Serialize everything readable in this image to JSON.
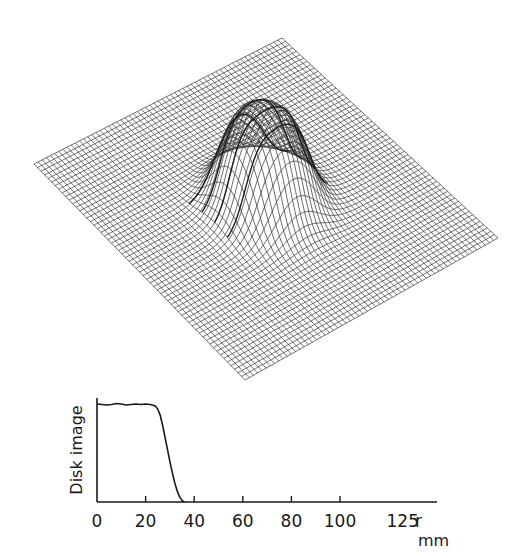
{
  "chart_data": [
    {
      "type": "surface",
      "name": "3D wire-mesh surface of disk image",
      "description": "Oblique wire-frame surface on a flat square grid, with a raised flat-topped cylindrical bump (disk) near the center",
      "plane_corners_px": {
        "top": [
          282,
          38
        ],
        "right": [
          498,
          238
        ],
        "bottom": [
          245,
          380
        ],
        "left": [
          34,
          164
        ]
      },
      "grid_lines_per_side": 60,
      "bump": {
        "center_uv": [
          0.5,
          0.5
        ],
        "radius_uv": 0.14,
        "height_px": 95,
        "edge_sharpness": 0.06
      },
      "line_color": "#3a3a3a"
    },
    {
      "type": "line",
      "title": "",
      "xlabel": "r",
      "xlabel_unit": "mm",
      "ylabel": "Disk image",
      "xlim": [
        0,
        140
      ],
      "ylim": [
        0,
        1.05
      ],
      "x_ticks": [
        0,
        20,
        40,
        60,
        80,
        100,
        125
      ],
      "x_tick_labels": [
        "0",
        "20",
        "40",
        "60",
        "80",
        "100",
        "125"
      ],
      "y_ticks": [],
      "grid": false,
      "series": [
        {
          "name": "Disk image profile",
          "x": [
            0,
            2,
            4,
            6,
            8,
            10,
            12,
            14,
            16,
            18,
            20,
            22,
            24,
            25,
            26,
            27,
            28,
            29,
            30,
            31,
            32,
            33,
            34,
            35,
            36
          ],
          "y": [
            0.97,
            0.965,
            0.96,
            0.965,
            0.975,
            0.97,
            0.96,
            0.965,
            0.97,
            0.965,
            0.97,
            0.965,
            0.95,
            0.92,
            0.86,
            0.76,
            0.64,
            0.52,
            0.4,
            0.29,
            0.19,
            0.11,
            0.05,
            0.015,
            0.0
          ]
        }
      ]
    }
  ],
  "profile": {
    "ylabel": "Disk image",
    "xlabel": "r",
    "unit": "mm",
    "tick_labels": [
      "0",
      "20",
      "40",
      "60",
      "80",
      "100",
      "125"
    ]
  }
}
